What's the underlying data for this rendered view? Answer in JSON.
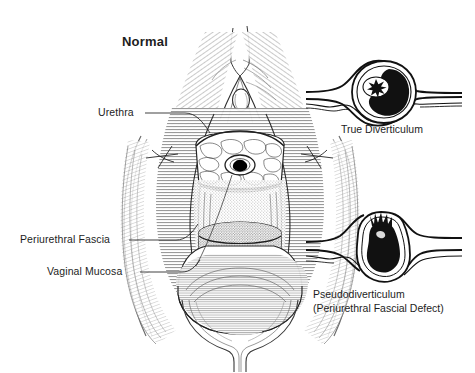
{
  "figure": {
    "title": "Normal",
    "background_color": "#ffffff",
    "ink_color": "#1a1a1a",
    "labels": {
      "urethra": "Urethra",
      "periurethral_fascia": "Periurethral Fascia",
      "vaginal_mucosa": "Vaginal Mucosa"
    },
    "panels": [
      {
        "id": "true-diverticulum",
        "caption_line_1": "True Diverticulum",
        "caption_line_2": ""
      },
      {
        "id": "pseudodiverticulum",
        "caption_line_1": "Pseudodiverticulum",
        "caption_line_2": "(Periurethral Fascial Defect)"
      }
    ]
  }
}
